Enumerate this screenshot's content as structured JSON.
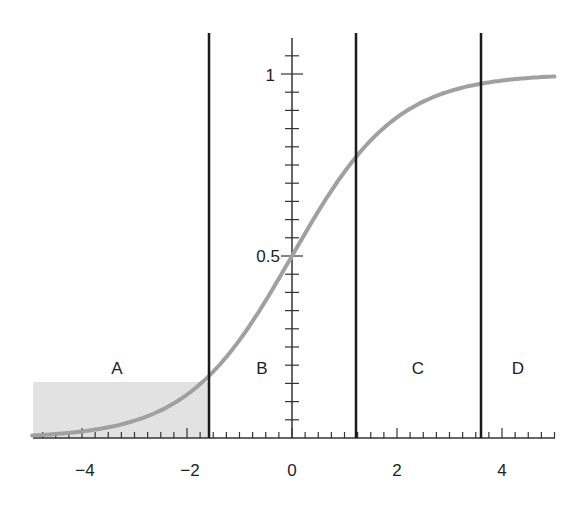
{
  "chart_data": {
    "type": "line",
    "title": "",
    "xlabel": "",
    "ylabel": "",
    "xlim": [
      -5,
      5
    ],
    "ylim": [
      0,
      1.1
    ],
    "grid": false,
    "function": "logistic sigmoid y = 1 / (1 + e^(-x))",
    "x_ticks": [
      -4,
      -2,
      0,
      2,
      4
    ],
    "x_tick_labels": [
      "−4",
      "−2",
      "0",
      "2",
      "4"
    ],
    "y_ticks": [
      0.5,
      1
    ],
    "y_tick_labels": [
      "0.5",
      "1"
    ],
    "series": [
      {
        "name": "sigmoid",
        "color": "#9a9a9a",
        "x": [
          -5,
          -4,
          -3,
          -2,
          -1.58,
          -1,
          0,
          1,
          1.22,
          2,
          3,
          3.6,
          4,
          5
        ],
        "y": [
          0.007,
          0.018,
          0.047,
          0.119,
          0.171,
          0.269,
          0.5,
          0.731,
          0.772,
          0.881,
          0.953,
          0.973,
          0.982,
          0.993
        ]
      }
    ],
    "vertical_lines": [
      -1.58,
      1.22,
      3.6
    ],
    "regions": [
      {
        "label": "A",
        "x_center": -3.3
      },
      {
        "label": "B",
        "x_center": -0.55
      },
      {
        "label": "C",
        "x_center": 2.4
      },
      {
        "label": "D",
        "x_center": 4.3
      }
    ],
    "shaded_area": {
      "x_from": -5,
      "x_to": -1.58,
      "y_from": 0,
      "y_to": 0.155,
      "color": "#e0e0e0"
    }
  },
  "labels": {
    "region_a": "A",
    "region_b": "B",
    "region_c": "C",
    "region_d": "D",
    "x_m4": "−4",
    "x_m2": "−2",
    "x_0": "0",
    "x_2": "2",
    "x_4": "4",
    "y_05": "0.5",
    "y_1": "1"
  }
}
